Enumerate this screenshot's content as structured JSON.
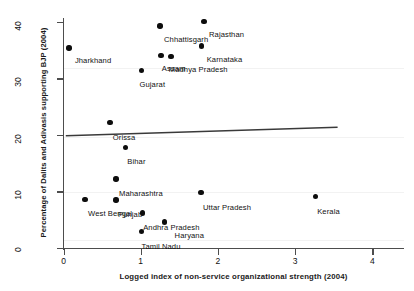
{
  "chart_data": {
    "type": "scatter",
    "title": "",
    "xlabel": "Logged index of non-service organizational strength (2004)",
    "ylabel": "Percentage of Dalits and Adivasis supporting BJP (2004)",
    "xlim": [
      -0.18,
      4.25
    ],
    "ylim": [
      -1.0,
      41.5
    ],
    "xticks": [
      0,
      1,
      2,
      3,
      4
    ],
    "yticks": [
      0,
      10,
      20,
      30,
      40
    ],
    "grid": false,
    "legend": null,
    "points": [
      {
        "label": "Jharkhand",
        "x": 0.07,
        "y": 35.4,
        "label_dx": 6,
        "label_dy": 8
      },
      {
        "label": "Chhattisgarh",
        "x": 1.25,
        "y": 39.3,
        "label_dx": 4,
        "label_dy": 9
      },
      {
        "label": "Rajasthan",
        "x": 1.82,
        "y": 40.1,
        "label_dx": 5,
        "label_dy": 9
      },
      {
        "label": "Karnataka",
        "x": 1.79,
        "y": 35.7,
        "label_dx": 5,
        "label_dy": 9
      },
      {
        "label": "Assam",
        "x": 1.26,
        "y": 34.1,
        "label_dx": 1,
        "label_dy": 9
      },
      {
        "label": "Madhya Pradesh",
        "x": 1.39,
        "y": 33.9,
        "label_dx": -2,
        "label_dy": 9
      },
      {
        "label": "Gujarat",
        "x": 1.01,
        "y": 31.4,
        "label_dx": -2,
        "label_dy": 10
      },
      {
        "label": "Orissa",
        "x": 0.6,
        "y": 22.2,
        "label_dx": 3,
        "label_dy": 10
      },
      {
        "label": "Bihar",
        "x": 0.8,
        "y": 17.8,
        "label_dx": 2,
        "label_dy": 10
      },
      {
        "label": "Maharashtra",
        "x": 0.68,
        "y": 12.2,
        "label_dx": 3,
        "label_dy": 10
      },
      {
        "label": "West Bengal",
        "x": 0.28,
        "y": 8.6,
        "label_dx": 3,
        "label_dy": 10
      },
      {
        "label": "Punjab",
        "x": 0.68,
        "y": 8.5,
        "label_dx": 2,
        "label_dy": 10
      },
      {
        "label": "Uttar Pradesh",
        "x": 1.78,
        "y": 9.8,
        "label_dx": 2,
        "label_dy": 10
      },
      {
        "label": "Kerala",
        "x": 3.26,
        "y": 9.1,
        "label_dx": 2,
        "label_dy": 10
      },
      {
        "label": "Andhra Pradesh",
        "x": 1.02,
        "y": 6.2,
        "label_dx": 1,
        "label_dy": 10
      },
      {
        "label": "Haryana",
        "x": 1.31,
        "y": 4.6,
        "label_dx": 10,
        "label_dy": 9
      },
      {
        "label": "Tamil Nadu",
        "x": 1.01,
        "y": 2.9,
        "label_dx": 0,
        "label_dy": 10
      }
    ],
    "trend_line": {
      "x0": 0.03,
      "y0": 19.85,
      "x1": 3.55,
      "y1": 21.35
    }
  }
}
